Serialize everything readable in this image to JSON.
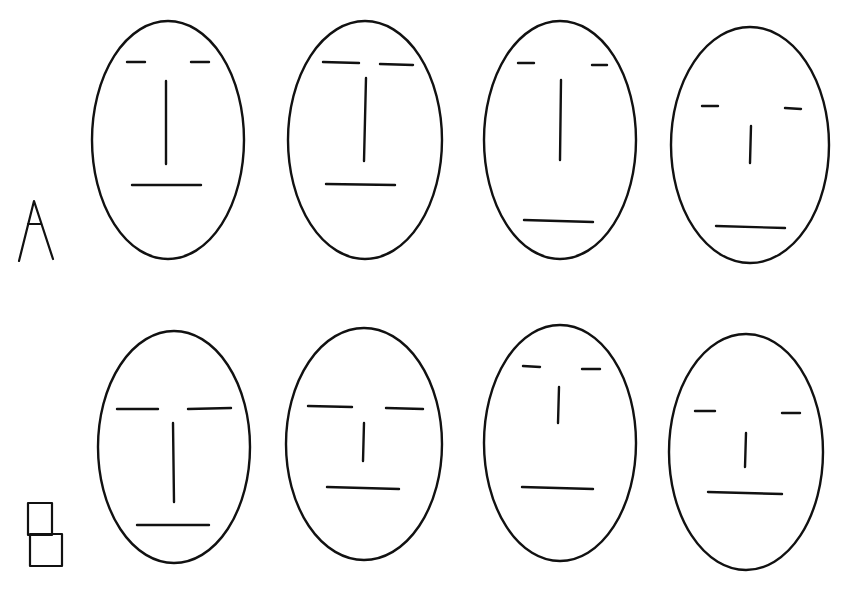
{
  "figure": {
    "width": 844,
    "height": 601,
    "background": "#ffffff",
    "stroke_color": "#111111",
    "rows": [
      {
        "label": "A",
        "label_glyph": "letter-A",
        "label_shape": {
          "type": "letter-a",
          "points": [
            [
              19,
              261
            ],
            [
              34,
              201
            ],
            [
              53,
              259
            ]
          ],
          "crossbar": [
            [
              28,
              224
            ],
            [
              41,
              224
            ]
          ]
        },
        "faces": [
          {
            "id": "A1",
            "outline": {
              "cx": 168,
              "cy": 140,
              "rx": 76,
              "ry": 119
            },
            "eyes": [
              [
                [
                  127,
                  62
                ],
                [
                  145,
                  62
                ]
              ],
              [
                [
                  191,
                  62
                ],
                [
                  209,
                  62
                ]
              ]
            ],
            "nose": [
              [
                166,
                81
              ],
              [
                166,
                164
              ]
            ],
            "mouth": [
              [
                132,
                185
              ],
              [
                201,
                185
              ]
            ]
          },
          {
            "id": "A2",
            "outline": {
              "cx": 365,
              "cy": 140,
              "rx": 77,
              "ry": 119
            },
            "eyes": [
              [
                [
                  323,
                  62
                ],
                [
                  359,
                  63
                ]
              ],
              [
                [
                  380,
                  64
                ],
                [
                  413,
                  65
                ]
              ]
            ],
            "nose": [
              [
                366,
                78
              ],
              [
                364,
                161
              ]
            ],
            "mouth": [
              [
                326,
                184
              ],
              [
                395,
                185
              ]
            ]
          },
          {
            "id": "A3",
            "outline": {
              "cx": 560,
              "cy": 140,
              "rx": 76,
              "ry": 119
            },
            "eyes": [
              [
                [
                  518,
                  63
                ],
                [
                  534,
                  63
                ]
              ],
              [
                [
                  592,
                  65
                ],
                [
                  607,
                  65
                ]
              ]
            ],
            "nose": [
              [
                561,
                80
              ],
              [
                560,
                160
              ]
            ],
            "mouth": [
              [
                524,
                220
              ],
              [
                593,
                222
              ]
            ]
          },
          {
            "id": "A4",
            "outline": {
              "cx": 750,
              "cy": 145,
              "rx": 79,
              "ry": 118
            },
            "eyes": [
              [
                [
                  702,
                  106
                ],
                [
                  718,
                  106
                ]
              ],
              [
                [
                  785,
                  108
                ],
                [
                  801,
                  109
                ]
              ]
            ],
            "nose": [
              [
                751,
                126
              ],
              [
                750,
                163
              ]
            ],
            "mouth": [
              [
                716,
                226
              ],
              [
                785,
                228
              ]
            ]
          }
        ]
      },
      {
        "label": "B",
        "label_glyph": "stacked-boxes",
        "label_shape": {
          "type": "stacked-boxes",
          "top_box": {
            "x": 28,
            "y": 503,
            "w": 24,
            "h": 32
          },
          "bottom_box": {
            "x": 30,
            "y": 534,
            "w": 32,
            "h": 32
          }
        },
        "faces": [
          {
            "id": "B1",
            "outline": {
              "cx": 174,
              "cy": 447,
              "rx": 76,
              "ry": 116
            },
            "eyes": [
              [
                [
                  117,
                  409
                ],
                [
                  158,
                  409
                ]
              ],
              [
                [
                  188,
                  409
                ],
                [
                  231,
                  408
                ]
              ]
            ],
            "nose": [
              [
                173,
                423
              ],
              [
                174,
                502
              ]
            ],
            "mouth": [
              [
                137,
                525
              ],
              [
                209,
                525
              ]
            ]
          },
          {
            "id": "B2",
            "outline": {
              "cx": 364,
              "cy": 444,
              "rx": 78,
              "ry": 116
            },
            "eyes": [
              [
                [
                  308,
                  406
                ],
                [
                  352,
                  407
                ]
              ],
              [
                [
                  386,
                  408
                ],
                [
                  423,
                  409
                ]
              ]
            ],
            "nose": [
              [
                364,
                423
              ],
              [
                363,
                461
              ]
            ],
            "mouth": [
              [
                327,
                487
              ],
              [
                399,
                489
              ]
            ]
          },
          {
            "id": "B3",
            "outline": {
              "cx": 560,
              "cy": 443,
              "rx": 76,
              "ry": 118
            },
            "eyes": [
              [
                [
                  523,
                  366
                ],
                [
                  540,
                  367
                ]
              ],
              [
                [
                  582,
                  369
                ],
                [
                  600,
                  369
                ]
              ]
            ],
            "nose": [
              [
                559,
                387
              ],
              [
                558,
                423
              ]
            ],
            "mouth": [
              [
                522,
                487
              ],
              [
                593,
                489
              ]
            ]
          },
          {
            "id": "B4",
            "outline": {
              "cx": 746,
              "cy": 452,
              "rx": 77,
              "ry": 118
            },
            "eyes": [
              [
                [
                  695,
                  411
                ],
                [
                  715,
                  411
                ]
              ],
              [
                [
                  782,
                  413
                ],
                [
                  800,
                  413
                ]
              ]
            ],
            "nose": [
              [
                746,
                433
              ],
              [
                745,
                467
              ]
            ],
            "mouth": [
              [
                708,
                492
              ],
              [
                782,
                494
              ]
            ]
          }
        ]
      }
    ]
  }
}
